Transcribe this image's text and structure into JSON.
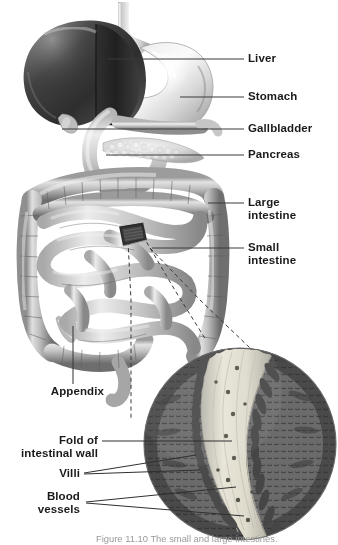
{
  "figure": {
    "caption": "Figure 11.10  The small and large intestines.",
    "background_color": "#ffffff",
    "label_color": "#1a1a1a",
    "leader_color": "#3a3a3a"
  },
  "labels": {
    "liver": "Liver",
    "stomach": "Stomach",
    "gallbladder": "Gallbladder",
    "pancreas": "Pancreas",
    "large_intestine": "Large\nintestine",
    "small_intestine": "Small\nintestine",
    "appendix": "Appendix",
    "fold": "Fold of\nintestinal wall",
    "villi": "Villi",
    "blood_vessels": "Blood\nvessels"
  },
  "organs": [
    {
      "name": "liver",
      "label": "Liver",
      "side": "right"
    },
    {
      "name": "stomach",
      "label": "Stomach",
      "side": "right"
    },
    {
      "name": "gallbladder",
      "label": "Gallbladder",
      "side": "right"
    },
    {
      "name": "pancreas",
      "label": "Pancreas",
      "side": "right"
    },
    {
      "name": "large-intestine",
      "label": "Large intestine",
      "side": "right"
    },
    {
      "name": "small-intestine",
      "label": "Small intestine",
      "side": "right"
    },
    {
      "name": "appendix",
      "label": "Appendix",
      "side": "left"
    },
    {
      "name": "fold",
      "label": "Fold of intestinal wall",
      "side": "left"
    },
    {
      "name": "villi",
      "label": "Villi",
      "side": "left"
    },
    {
      "name": "blood-vessels",
      "label": "Blood vessels",
      "side": "left"
    }
  ],
  "inset": {
    "name": "villi-magnification",
    "shape": "circle",
    "center_x": 240,
    "center_y": 444,
    "radius": 96,
    "description": "Magnified cross-section of small intestine wall showing fold, villi and blood vessels"
  }
}
